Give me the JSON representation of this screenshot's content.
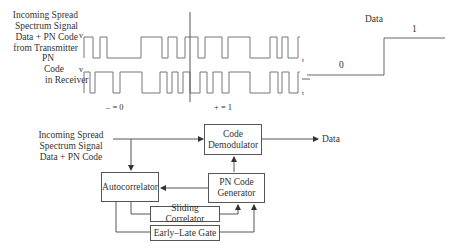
{
  "waveforms": {
    "incoming_label": [
      "Incoming Spread",
      "Spectrum Signal",
      "Data + PN Code",
      "from Transmitter"
    ],
    "pn_label": [
      "PN",
      "Code",
      "in Receiver"
    ],
    "v_label_top": "v",
    "v_label_bottom": "v",
    "t_label_top": "t",
    "t_label_bottom": "t",
    "minus_label": "– = 0",
    "plus_label": "+ = 1",
    "top_edges": [
      84,
      93,
      100,
      107,
      141,
      162,
      168,
      177,
      185,
      198,
      205,
      222,
      228,
      250,
      270,
      277,
      282,
      288,
      298
    ],
    "bottom_edges": [
      84,
      90,
      95,
      113,
      120,
      142,
      160,
      167,
      172,
      178,
      183,
      190,
      200,
      207,
      213,
      222,
      229,
      250,
      270,
      278,
      282,
      289,
      298
    ],
    "colors": {
      "line": "#777777",
      "text": "#333333"
    }
  },
  "data_plot": {
    "title": "Data",
    "low_label": "0",
    "high_label": "1"
  },
  "block_diagram": {
    "input_label": [
      "Incoming Spread",
      "Spectrum Signal",
      "Data + PN Code"
    ],
    "code_demodulator": [
      "Code",
      "Demodulator"
    ],
    "output_label": "Data",
    "autocorrelator": "Autocorrelator",
    "pn_code_generator": [
      "PN Code",
      "Generator"
    ],
    "sliding_correlator": "Sliding Correlator",
    "early_late_gate": "Early–Late Gate"
  }
}
